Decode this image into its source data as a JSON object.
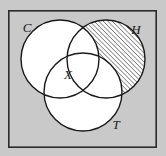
{
  "figure": {
    "kind": "venn-diagram",
    "title": "",
    "background_color": "#c9c9c9",
    "panel_fill_color": "#c9c9c9",
    "border_color": "#2b2b2b",
    "circle_fill_color": "#ffffff",
    "circle_stroke_color": "#1a1a1a",
    "hatch_color": "#1a1a1a",
    "label_color": "#1a1a1a"
  },
  "frame": {
    "x": 8,
    "y": 10,
    "width": 149,
    "height": 138,
    "stroke_width": 1.6
  },
  "sets": [
    {
      "id": "C",
      "label": "C",
      "label_x": 27,
      "label_y": 32,
      "cx": 60,
      "cy": 59,
      "r": 39,
      "shaded": false
    },
    {
      "id": "H",
      "label": "H",
      "label_x": 136,
      "label_y": 34,
      "cx": 106,
      "cy": 59,
      "r": 39,
      "shaded": true
    },
    {
      "id": "T",
      "label": "T",
      "label_x": 116,
      "label_y": 129,
      "cx": 83,
      "cy": 92,
      "r": 39,
      "shaded": false
    }
  ],
  "points": [
    {
      "id": "X",
      "label": "X",
      "label_x": 68,
      "label_y": 79
    }
  ],
  "shading": {
    "region_description": "H only (H minus C minus T)",
    "pattern": "diagonal-hatch",
    "angle_degrees": 45,
    "spacing_px": 3.2,
    "line_width": 0.9
  }
}
